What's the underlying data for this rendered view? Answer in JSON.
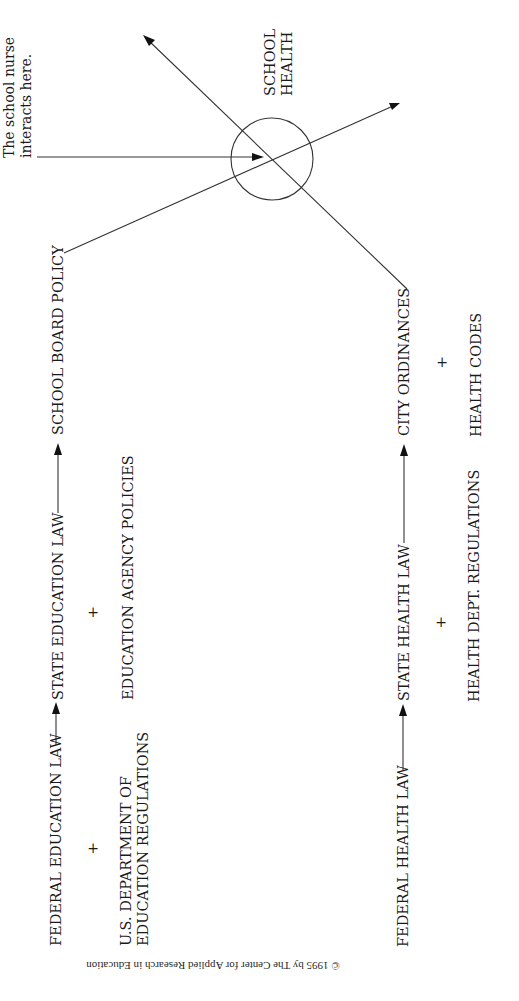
{
  "diagram": {
    "orientation": "rotated 90 degrees counter-clockwise (text reads bottom-to-top)",
    "center": {
      "label_line1": "SCHOOL",
      "label_line2": "HEALTH"
    },
    "annotation": {
      "line1": "The school nurse",
      "line2": "interacts here."
    },
    "education_chain": {
      "federal": "FEDERAL EDUCATION LAW",
      "state": "STATE EDUCATION LAW",
      "local": "SCHOOL BOARD POLICY",
      "federal_addition_line1": "U.S. DEPARTMENT OF",
      "federal_addition_line2": "EDUCATION REGULATIONS",
      "state_addition": "EDUCATION AGENCY POLICIES",
      "plus": "+"
    },
    "health_chain": {
      "federal": "FEDERAL HEALTH LAW",
      "state": "STATE HEALTH LAW",
      "local": "CITY ORDINANCES",
      "state_addition": "HEALTH DEPT. REGULATIONS",
      "local_addition": "HEALTH CODES",
      "plus": "+"
    },
    "copyright": "© 1995 by The Center for Applied Research in Education",
    "colors": {
      "ink": "#1a1a1a",
      "background": "#ffffff"
    }
  }
}
